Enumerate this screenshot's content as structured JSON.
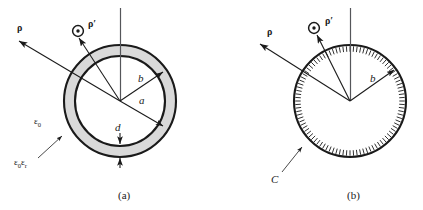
{
  "figure": {
    "background_color": "#ffffff",
    "line_color": "#1a1a1a",
    "shell_fill_color": "#d9d9d9"
  },
  "panels": [
    {
      "id": "a",
      "caption": "(a)",
      "description": "Annular dielectric shell cross-section",
      "center": {
        "x": 120,
        "y": 101
      },
      "radii": {
        "outer": 56,
        "inner": 45
      },
      "labels": {
        "rho": "ρ",
        "rho_prime": "ρ′",
        "radius_outer": "b",
        "radius_inner": "a",
        "thickness": "d",
        "permittivity_free": "ε",
        "permittivity_free_sub": "0",
        "permittivity_mat": "ε",
        "permittivity_mat_sub1": "0",
        "permittivity_mat_sub2": "ε",
        "permittivity_mat_sub3": "r"
      }
    },
    {
      "id": "b",
      "caption": "(b)",
      "description": "Solid disk bounded by hatched contour C",
      "center": {
        "x": 350,
        "y": 101
      },
      "radii": {
        "outer": 56
      },
      "labels": {
        "rho": "ρ",
        "rho_prime": "ρ′",
        "radius_outer": "b",
        "contour": "C"
      }
    }
  ]
}
